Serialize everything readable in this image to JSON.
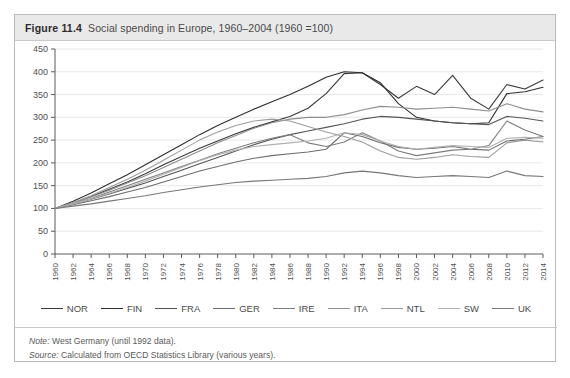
{
  "figure": {
    "label": "Figure 11.4",
    "title": "Social spending in Europe, 1960–2004 (1960 =100)"
  },
  "footer": {
    "note_key": "Note:",
    "note_text": "West Germany (until 1992 data).",
    "source_key": "Source:",
    "source_text": "Calculated from OECD Statistics Library (various years)."
  },
  "chart_data": {
    "type": "line",
    "title": "Social spending in Europe, 1960–2004 (1960 =100)",
    "xlabel": "",
    "ylabel": "",
    "grid": true,
    "legend_position": "bottom",
    "xlim": [
      1960,
      2014
    ],
    "ylim": [
      0,
      450
    ],
    "yticks": [
      0,
      50,
      100,
      150,
      200,
      250,
      300,
      350,
      400,
      450
    ],
    "xticks": [
      1960,
      1962,
      1964,
      1966,
      1968,
      1970,
      1972,
      1974,
      1976,
      1978,
      1980,
      1982,
      1984,
      1986,
      1988,
      1990,
      1992,
      1994,
      1996,
      1998,
      2000,
      2002,
      2004,
      2006,
      2008,
      2010,
      2012,
      2014
    ],
    "x": [
      1960,
      1962,
      1964,
      1966,
      1968,
      1970,
      1972,
      1974,
      1976,
      1978,
      1980,
      1982,
      1984,
      1986,
      1988,
      1990,
      1992,
      1994,
      1996,
      1998,
      2000,
      2002,
      2004,
      2006,
      2008,
      2010,
      2012,
      2014
    ],
    "series": [
      {
        "name": "NOR",
        "color": "#3a3a3a",
        "values": [
          100,
          112,
          126,
          142,
          158,
          176,
          196,
          214,
          232,
          248,
          264,
          278,
          290,
          302,
          320,
          352,
          396,
          398,
          372,
          342,
          368,
          350,
          392,
          342,
          318,
          372,
          362,
          382
        ]
      },
      {
        "name": "FIN",
        "color": "#2e2e2e",
        "values": [
          100,
          116,
          134,
          154,
          174,
          196,
          218,
          240,
          262,
          282,
          300,
          318,
          334,
          350,
          368,
          388,
          400,
          398,
          376,
          330,
          300,
          292,
          288,
          286,
          288,
          352,
          356,
          366
        ]
      },
      {
        "name": "FRA",
        "color": "#555555",
        "values": [
          100,
          110,
          120,
          132,
          144,
          156,
          170,
          184,
          198,
          212,
          226,
          240,
          252,
          262,
          270,
          278,
          286,
          296,
          302,
          300,
          296,
          292,
          288,
          286,
          284,
          302,
          298,
          292
        ]
      },
      {
        "name": "GER",
        "color": "#6d6d6d",
        "values": [
          100,
          108,
          117,
          126,
          136,
          146,
          158,
          170,
          182,
          192,
          202,
          210,
          216,
          220,
          224,
          230,
          266,
          258,
          244,
          234,
          230,
          232,
          236,
          230,
          228,
          248,
          252,
          258
        ]
      },
      {
        "name": "IRE",
        "color": "#7e7e7e",
        "values": [
          100,
          110,
          122,
          136,
          150,
          164,
          178,
          192,
          206,
          220,
          232,
          244,
          254,
          262,
          244,
          236,
          246,
          266,
          248,
          226,
          216,
          222,
          228,
          230,
          238,
          292,
          272,
          258
        ]
      },
      {
        "name": "ITA",
        "color": "#8f8f8f",
        "values": [
          100,
          112,
          125,
          140,
          156,
          172,
          190,
          208,
          226,
          244,
          260,
          276,
          288,
          296,
          300,
          300,
          306,
          316,
          324,
          322,
          318,
          320,
          322,
          318,
          314,
          330,
          318,
          312
        ]
      },
      {
        "name": "NTL",
        "color": "#9d9d9d",
        "values": [
          100,
          113,
          128,
          146,
          164,
          184,
          206,
          228,
          250,
          268,
          282,
          292,
          296,
          292,
          280,
          268,
          258,
          246,
          226,
          212,
          208,
          212,
          218,
          214,
          212,
          244,
          250,
          246
        ]
      },
      {
        "name": "SW",
        "color": "#b0b0b0",
        "values": [
          100,
          110,
          121,
          133,
          146,
          160,
          175,
          190,
          205,
          218,
          228,
          236,
          240,
          244,
          248,
          254,
          266,
          262,
          248,
          236,
          230,
          234,
          238,
          236,
          234,
          254,
          256,
          254
        ]
      },
      {
        "name": "UK",
        "color": "#777777",
        "values": [
          100,
          105,
          110,
          116,
          122,
          128,
          135,
          141,
          147,
          152,
          157,
          160,
          162,
          164,
          166,
          170,
          178,
          182,
          178,
          172,
          168,
          170,
          172,
          170,
          168,
          182,
          172,
          170
        ]
      }
    ]
  },
  "legend": {
    "items": [
      {
        "label": "NOR"
      },
      {
        "label": "FIN"
      },
      {
        "label": "FRA"
      },
      {
        "label": "GER"
      },
      {
        "label": "IRE"
      },
      {
        "label": "ITA"
      },
      {
        "label": "NTL"
      },
      {
        "label": "SW"
      },
      {
        "label": "UK"
      }
    ]
  }
}
